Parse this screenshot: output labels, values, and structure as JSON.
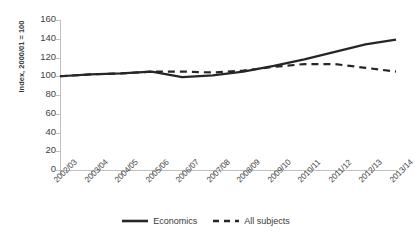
{
  "chart_data": {
    "type": "line",
    "title": "",
    "xlabel": "",
    "ylabel": "Index, 2000/01 = 100",
    "categories": [
      "2002/03",
      "2003/04",
      "2004/05",
      "2005/06",
      "2006/07",
      "2007/08",
      "2008/09",
      "2009/10",
      "2010/11",
      "2011/12",
      "2012/13",
      "2013/14"
    ],
    "ylim": [
      0,
      160
    ],
    "yticks": [
      0,
      20,
      40,
      60,
      80,
      100,
      120,
      140,
      160
    ],
    "grid": false,
    "legend_position": "bottom",
    "series": [
      {
        "name": "Economics",
        "style": "solid",
        "color": "#262626",
        "values": [
          100,
          102,
          103,
          105,
          99,
          101,
          105,
          111,
          118,
          126,
          134,
          139
        ]
      },
      {
        "name": "All subjects",
        "style": "dashed",
        "color": "#262626",
        "values": [
          100,
          102,
          103,
          105,
          105,
          104,
          106,
          110,
          113,
          113,
          109,
          105
        ]
      }
    ]
  },
  "legend": {
    "items": [
      {
        "label": "Economics",
        "style": "solid"
      },
      {
        "label": "All subjects",
        "style": "dashed"
      }
    ]
  },
  "axis": {
    "line_color": "#bfbfbf",
    "tick_color": "#bfbfbf"
  }
}
